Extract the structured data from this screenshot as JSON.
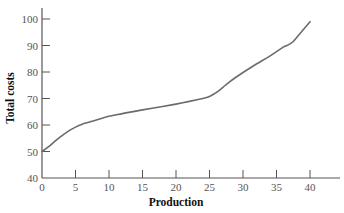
{
  "chart_data": {
    "type": "line",
    "title": "",
    "xlabel": "Production",
    "ylabel": "Total costs",
    "xlim": [
      0,
      45
    ],
    "ylim": [
      40,
      100
    ],
    "x_ticks": [
      0,
      5,
      10,
      15,
      20,
      25,
      30,
      35,
      40
    ],
    "y_ticks": [
      40,
      50,
      60,
      70,
      80,
      90,
      100
    ],
    "grid": false,
    "legend": null,
    "series": [
      {
        "name": "Total costs",
        "color": "#6b6b6b",
        "x": [
          0,
          1,
          2,
          3,
          4,
          5,
          6,
          7,
          8,
          10,
          12,
          15,
          18,
          20,
          22,
          24,
          25,
          26,
          27,
          28,
          30,
          32,
          34,
          36,
          37.5,
          40
        ],
        "y": [
          50,
          51.8,
          54,
          56,
          57.8,
          59.2,
          60.3,
          61,
          61.8,
          63.3,
          64.3,
          65.7,
          67,
          67.9,
          68.9,
          70,
          70.8,
          72.2,
          74.2,
          76.3,
          79.8,
          83,
          86,
          89.4,
          91.5,
          99
        ]
      }
    ]
  }
}
